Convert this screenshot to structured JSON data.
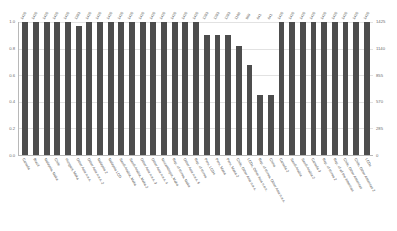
{
  "chart_data": {
    "type": "bar",
    "title": "",
    "xlabel": "",
    "ylabel": "",
    "ylim": [
      0,
      1.0
    ],
    "y2lim": [
      0,
      1425
    ],
    "grid": true,
    "legend": "none",
    "bar_color": "#4d4d4d",
    "background": "#ffffff",
    "y_ticks_left": [
      "0.0",
      "0.2",
      "0.4",
      "0.6",
      "0.8",
      "1.0"
    ],
    "y_ticks_right": [
      "0",
      "285",
      "570",
      "855",
      "1140",
      "1425"
    ],
    "categories": [
      "Canada",
      "Brazil",
      "Malaysia, Maka",
      "Chile",
      "Hungary, Maka",
      "Other Asia n.e.s.",
      "Other Asia n.e.s. 2",
      "Malaysia 2",
      "Malaysia LCD",
      "Saudi Arabia, Maka",
      "Saudi Arabia, Maka 2",
      "Other Asia n.e.s. 3",
      "Other Asia n.e.s. 4",
      "Mozambique, Maka",
      "Rep. of Korea, Maka",
      "Other Asia n.e.s. 5",
      "Rep. of Korea",
      "Peru, LCDs",
      "Peru, Maka",
      "Peru, Maka 2",
      "Chile, Other Asia n.e.s.",
      "LCDs, Other Asia n.e.s.",
      "Rep. of Korea, Other Asia n.e.s.",
      "China",
      "Canada 2",
      "Saudi Arabia",
      "Saudi Arabia 2",
      "Canada 3",
      "Rep. of Korea 2",
      "Rep. of all the Americas",
      "Chile, Other Americas",
      "Chile, Other Americas 2",
      "LCDs"
    ],
    "values": [
      1.0,
      1.0,
      1.0,
      1.0,
      1.0,
      0.97,
      1.0,
      1.0,
      1.0,
      1.0,
      1.0,
      1.0,
      1.0,
      1.0,
      1.0,
      1.0,
      1.0,
      0.9,
      0.9,
      0.9,
      0.82,
      0.68,
      0.45,
      0.45,
      1.0,
      1.0,
      1.0,
      1.0,
      1.0,
      1.0,
      1.0,
      1.0,
      1.0
    ],
    "value_labels": [
      "1425",
      "1425",
      "1425",
      "1425",
      "1425",
      "1383",
      "1425",
      "1425",
      "1425",
      "1425",
      "1425",
      "1425",
      "1425",
      "1425",
      "1425",
      "1425",
      "1425",
      "1283",
      "1283",
      "1283",
      "1168",
      "969",
      "641",
      "641",
      "1425",
      "1425",
      "1425",
      "1425",
      "1425",
      "1425",
      "1425",
      "1425",
      "1425"
    ]
  }
}
